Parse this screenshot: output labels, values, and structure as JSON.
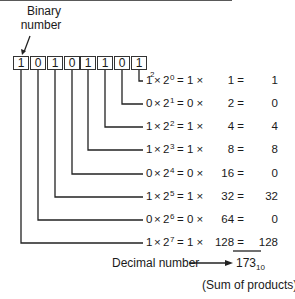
{
  "caption_top": [
    "Binary",
    "number"
  ],
  "binary_digits": [
    "1",
    "0",
    "1",
    "0",
    "1",
    "1",
    "0",
    "1"
  ],
  "base_subscript": "2",
  "rows": [
    {
      "bit": "1",
      "exp": "0",
      "mult": "1 ×",
      "place": "1 =",
      "prod": "1"
    },
    {
      "bit": "0",
      "exp": "1",
      "mult": "0 ×",
      "place": "2 =",
      "prod": "0"
    },
    {
      "bit": "1",
      "exp": "2",
      "mult": "1 ×",
      "place": "4 =",
      "prod": "4"
    },
    {
      "bit": "1",
      "exp": "3",
      "mult": "1 ×",
      "place": "8 =",
      "prod": "8"
    },
    {
      "bit": "0",
      "exp": "4",
      "mult": "0 ×",
      "place": "16 =",
      "prod": "0"
    },
    {
      "bit": "1",
      "exp": "5",
      "mult": "1 ×",
      "place": "32 =",
      "prod": "32"
    },
    {
      "bit": "0",
      "exp": "6",
      "mult": "0 ×",
      "place": "64 =",
      "prod": "0"
    },
    {
      "bit": "1",
      "exp": "7",
      "mult": "1 ×",
      "place": "128 =",
      "prod": "128"
    }
  ],
  "decimal_label": "Decimal number",
  "result": "173",
  "result_base": "10",
  "sum_note": "(Sum of products)"
}
